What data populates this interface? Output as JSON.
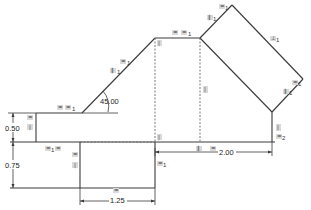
{
  "drawing": {
    "type": "2D sketch with geometric constraints",
    "dimensions": {
      "angle": "45.00",
      "height_upper": "0.50",
      "height_lower": "0.75",
      "width_bottom": "1.25",
      "width_right": "2.00"
    },
    "constraint_labels": {
      "horizontal": "=",
      "equal_1": "=",
      "equal_2": "=",
      "index_1": "1",
      "index_2": "2",
      "vertical": "|",
      "parallel": "∥",
      "perpendicular": "⊥"
    }
  },
  "colors": {
    "line": "#3a3a3a",
    "construction": "#6a6a6a",
    "constraint_bg": "#d9d9d9",
    "background": "#ffffff"
  }
}
